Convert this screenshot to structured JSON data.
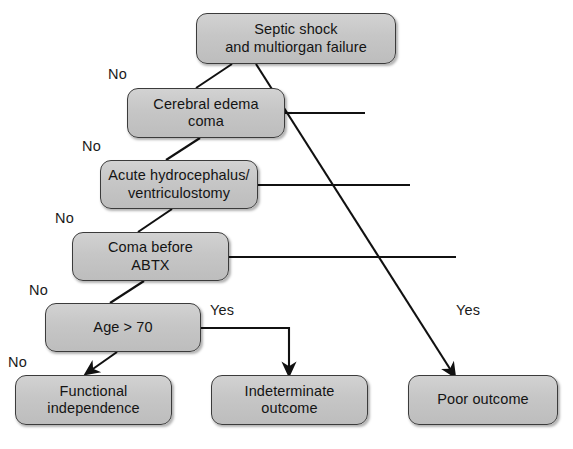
{
  "diagram": {
    "colors": {
      "box_fill": "#c8c8c8",
      "box_border": "#3b3b3b",
      "line": "#111111",
      "text": "#141414",
      "background": "#ffffff"
    },
    "nodes": [
      {
        "id": "septic-shock",
        "label": "Septic shock\nand multiorgan failure",
        "type": "root",
        "x": 196,
        "y": 13,
        "w": 200,
        "h": 51
      },
      {
        "id": "cerebral-edema",
        "label": "Cerebral edema\ncoma",
        "type": "decision",
        "x": 127,
        "y": 88,
        "w": 158,
        "h": 50
      },
      {
        "id": "acute-hydrocephalus",
        "label": "Acute hydrocephalus/\nventriculostomy",
        "type": "decision",
        "x": 100,
        "y": 160,
        "w": 158,
        "h": 49
      },
      {
        "id": "coma-before-abtx",
        "label": "Coma before\nABTX",
        "type": "decision",
        "x": 72,
        "y": 232,
        "w": 157,
        "h": 49
      },
      {
        "id": "age-over-70",
        "label": "Age > 70",
        "type": "decision",
        "x": 45,
        "y": 303,
        "w": 156,
        "h": 49
      },
      {
        "id": "functional-independence",
        "label": "Functional\nindependence",
        "type": "outcome",
        "x": 15,
        "y": 375,
        "w": 157,
        "h": 50
      },
      {
        "id": "indeterminate-outcome",
        "label": "Indeterminate\noutcome",
        "type": "outcome",
        "x": 211,
        "y": 375,
        "w": 157,
        "h": 50
      },
      {
        "id": "poor-outcome",
        "label": "Poor outcome",
        "type": "outcome",
        "x": 408,
        "y": 375,
        "w": 150,
        "h": 50
      }
    ],
    "edge_labels": [
      {
        "id": "no-1",
        "text": "No",
        "x": 108,
        "y": 67
      },
      {
        "id": "no-2",
        "text": "No",
        "x": 82,
        "y": 139
      },
      {
        "id": "no-3",
        "text": "No",
        "x": 55,
        "y": 211
      },
      {
        "id": "no-4",
        "text": "No",
        "x": 29,
        "y": 283
      },
      {
        "id": "no-5",
        "text": "No",
        "x": 8,
        "y": 355
      },
      {
        "id": "yes-1",
        "text": "Yes",
        "x": 210,
        "y": 303
      },
      {
        "id": "yes-2",
        "text": "Yes",
        "x": 456,
        "y": 303
      }
    ],
    "edges": [
      {
        "id": "edge-septic-to-cerebral",
        "from": "septic-shock",
        "to": "cerebral-edema",
        "label": "No",
        "arrow": false
      },
      {
        "id": "edge-cerebral-to-hydrocephalus",
        "from": "cerebral-edema",
        "to": "acute-hydrocephalus",
        "label": "No",
        "arrow": false
      },
      {
        "id": "edge-hydrocephalus-to-coma",
        "from": "acute-hydrocephalus",
        "to": "coma-before-abtx",
        "label": "No",
        "arrow": false
      },
      {
        "id": "edge-coma-to-age",
        "from": "coma-before-abtx",
        "to": "age-over-70",
        "label": "No",
        "arrow": false
      },
      {
        "id": "edge-age-to-functional",
        "from": "age-over-70",
        "to": "functional-independence",
        "label": "No",
        "arrow": true
      },
      {
        "id": "edge-age-to-indeterminate",
        "from": "age-over-70",
        "to": "indeterminate-outcome",
        "label": "Yes",
        "arrow": true
      },
      {
        "id": "edge-cerebral-to-poor",
        "from": "cerebral-edema",
        "to": "poor-outcome",
        "label": "",
        "arrow": false
      },
      {
        "id": "edge-hydrocephalus-to-poor",
        "from": "acute-hydrocephalus",
        "to": "poor-outcome",
        "label": "",
        "arrow": false
      },
      {
        "id": "edge-coma-to-poor",
        "from": "coma-before-abtx",
        "to": "poor-outcome",
        "label": "",
        "arrow": false
      },
      {
        "id": "edge-septic-to-poor",
        "from": "septic-shock",
        "to": "poor-outcome",
        "label": "Yes",
        "arrow": true
      }
    ]
  }
}
